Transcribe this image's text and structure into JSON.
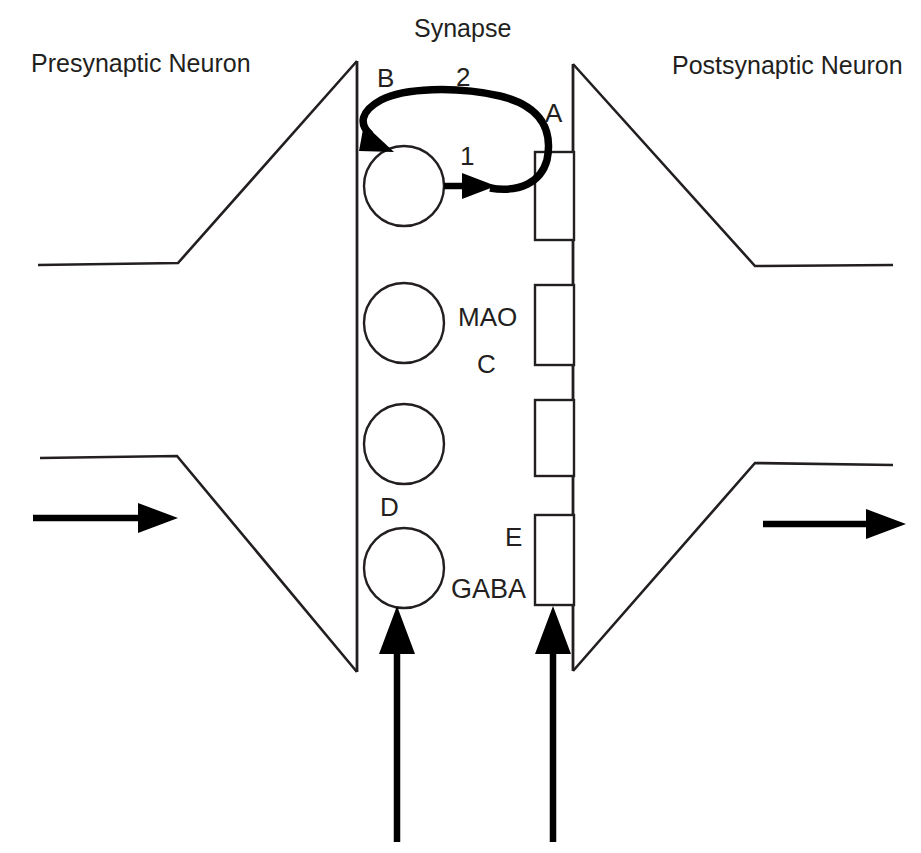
{
  "figure": {
    "title": "Synapse",
    "kind": "synapse-neurotransmission-diagram",
    "background_color": "#ffffff",
    "line_color": "#231f20"
  },
  "labels": {
    "title": "Synapse",
    "presynaptic_neuron": "Presynaptic Neuron",
    "postsynaptic_neuron": "Postsynaptic Neuron",
    "letter_a": "A",
    "letter_b": "B",
    "letter_c": "C",
    "letter_d": "D",
    "letter_e": "E",
    "number_1": "1",
    "number_2": "2",
    "enzyme_mao": "MAO",
    "neurotransmitter_gaba": "GABA"
  },
  "elements": {
    "vesicle_count": 4,
    "receptor_count": 4,
    "arrow_count_bold_up": 2,
    "arrow_count_flow_right": 2,
    "release_arrow_label": "1",
    "reuptake_arrow_label": "2"
  }
}
